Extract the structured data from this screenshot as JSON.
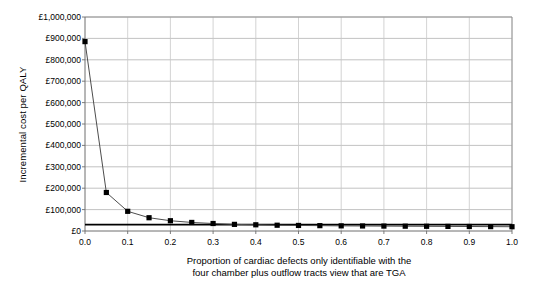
{
  "chart_data": {
    "type": "line",
    "title": "",
    "subtitle": "",
    "xlabel_line1": "Proportion of cardiac defects only identifiable with the",
    "xlabel_line2": "four chamber plus outflow tracts view that are TGA",
    "ylabel": "Incremental cost per QALY",
    "xlim": [
      0.0,
      1.0
    ],
    "ylim": [
      0,
      1000000
    ],
    "grid": "horizontal-and-vertical",
    "legend": "none",
    "currency_symbol": "£",
    "xticks": [
      0.0,
      0.1,
      0.2,
      0.3,
      0.4,
      0.5,
      0.6,
      0.7,
      0.8,
      0.9,
      1.0
    ],
    "xtick_labels": [
      "0.0",
      "0.1",
      "0.2",
      "0.3",
      "0.4",
      "0.5",
      "0.6",
      "0.7",
      "0.8",
      "0.9",
      "1.0"
    ],
    "yticks": [
      0,
      100000,
      200000,
      300000,
      400000,
      500000,
      600000,
      700000,
      800000,
      900000,
      1000000
    ],
    "ytick_labels": [
      "£0",
      "£100,000",
      "£200,000",
      "£300,000",
      "£400,000",
      "£500,000",
      "£600,000",
      "£700,000",
      "£800,000",
      "£900,000",
      "£1,000,000"
    ],
    "series": [
      {
        "name": "Incremental cost per QALY",
        "marker": "square",
        "marker_color": "#000000",
        "line_color": "#4d4d4d",
        "x": [
          0.0,
          0.05,
          0.1,
          0.15,
          0.2,
          0.25,
          0.3,
          0.35,
          0.4,
          0.45,
          0.5,
          0.55,
          0.6,
          0.65,
          0.7,
          0.75,
          0.8,
          0.85,
          0.9,
          0.95,
          1.0
        ],
        "values": [
          885000,
          180000,
          92000,
          62000,
          48000,
          40000,
          35000,
          31000,
          29000,
          27000,
          26000,
          25000,
          24000,
          23500,
          23000,
          22500,
          22000,
          21500,
          21000,
          20500,
          20000
        ]
      }
    ],
    "reference_lines": [
      {
        "name": "threshold-line",
        "orientation": "horizontal",
        "value": 30000,
        "color": "#000000",
        "width": 1.6
      }
    ]
  }
}
